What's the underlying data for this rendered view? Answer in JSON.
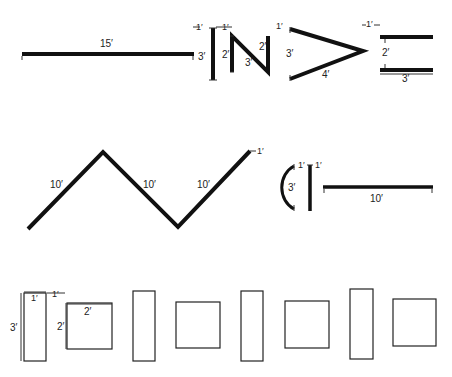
{
  "figure": {
    "row1": {
      "long_line": {
        "label": "15′"
      },
      "letter_i": {
        "height_label": "3′",
        "left_spacing_label": "1′",
        "right_spacing_label": "1′"
      },
      "letter_n": {
        "left_label": "2′",
        "diagonal_label": "3′",
        "right_label": "2′"
      },
      "chevron": {
        "spacing_label": "1′",
        "height_label": "3′",
        "lower_label": "4′"
      },
      "equals": {
        "spacing_label": "1′",
        "gap_label": "2′",
        "width_label": "3′"
      }
    },
    "row2": {
      "zigzag": {
        "segment1_label": "10′",
        "segment2_label": "10′",
        "segment3_label": "10′",
        "end_spacing_label": "1′"
      },
      "arc": {
        "height_label": "3′",
        "spacing_label": "1′"
      },
      "post": {
        "spacing_label": "1′"
      },
      "long_line": {
        "label": "10′"
      }
    },
    "row3": {
      "tall_rect": {
        "height_label": "3′",
        "width_label": "1′",
        "spacing_label": "1′"
      },
      "square": {
        "width_label": "2′",
        "height_label": "2′"
      }
    }
  }
}
